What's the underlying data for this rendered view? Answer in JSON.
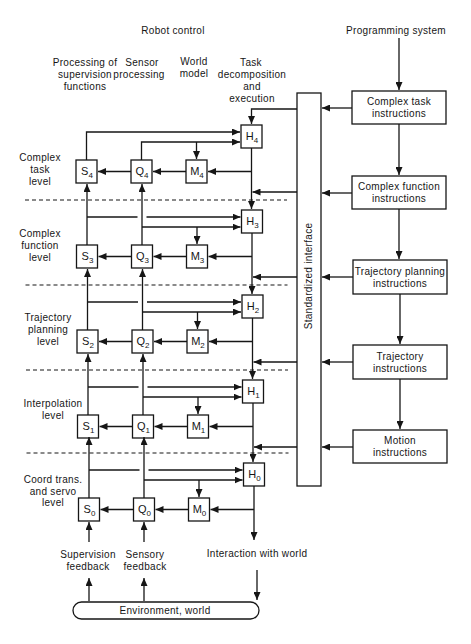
{
  "header": {
    "title": "Robot control",
    "programming_system": "Programming system"
  },
  "columns": {
    "supervision": [
      "Processing of",
      "supervision",
      "functions"
    ],
    "sensor": [
      "Sensor",
      "processing"
    ],
    "world_model": [
      "World",
      "model"
    ],
    "task": [
      "Task",
      "decomposition",
      "and",
      "execution"
    ]
  },
  "levels": [
    {
      "name": [
        "Complex",
        "task",
        "level"
      ],
      "boxes": {
        "S": {
          "letter": "S",
          "sub": "4"
        },
        "Q": {
          "letter": "Q",
          "sub": "4"
        },
        "M": {
          "letter": "M",
          "sub": "4"
        },
        "H": {
          "letter": "H",
          "sub": "4"
        }
      }
    },
    {
      "name": [
        "Complex",
        "function",
        "level"
      ],
      "boxes": {
        "S": {
          "letter": "S",
          "sub": "3"
        },
        "Q": {
          "letter": "Q",
          "sub": "3"
        },
        "M": {
          "letter": "M",
          "sub": "3"
        },
        "H": {
          "letter": "H",
          "sub": "3"
        }
      }
    },
    {
      "name": [
        "Trajectory",
        "planning",
        "level"
      ],
      "boxes": {
        "S": {
          "letter": "S",
          "sub": "2"
        },
        "Q": {
          "letter": "Q",
          "sub": "2"
        },
        "M": {
          "letter": "M",
          "sub": "2"
        },
        "H": {
          "letter": "H",
          "sub": "2"
        }
      }
    },
    {
      "name": [
        "Interpolation",
        "level"
      ],
      "boxes": {
        "S": {
          "letter": "S",
          "sub": "1"
        },
        "Q": {
          "letter": "Q",
          "sub": "1"
        },
        "M": {
          "letter": "M",
          "sub": "1"
        },
        "H": {
          "letter": "H",
          "sub": "1"
        }
      }
    },
    {
      "name": [
        "Coord trans.",
        "and servo",
        "level"
      ],
      "boxes": {
        "S": {
          "letter": "S",
          "sub": "0"
        },
        "Q": {
          "letter": "Q",
          "sub": "0"
        },
        "M": {
          "letter": "M",
          "sub": "0"
        },
        "H": {
          "letter": "H",
          "sub": "0"
        }
      }
    }
  ],
  "interface_label": "Standardized interface",
  "instructions": [
    [
      "Complex task",
      "instructions"
    ],
    [
      "Complex function",
      "instructions"
    ],
    [
      "Trajectory planning",
      "instructions"
    ],
    [
      "Trajectory",
      "instructions"
    ],
    [
      "Motion",
      "instructions"
    ]
  ],
  "bottom": {
    "supervision_feedback": [
      "Supervision",
      "feedback"
    ],
    "sensory_feedback": [
      "Sensory",
      "feedback"
    ],
    "interaction": "Interaction with world",
    "environment": "Environment, world"
  }
}
